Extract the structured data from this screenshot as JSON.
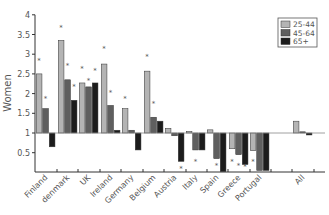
{
  "chart_data": {
    "type": "bar",
    "title": "",
    "xlabel": "",
    "ylabel": "Women",
    "ylim": [
      0.2,
      4
    ],
    "baseline": 1,
    "yticks": [
      0.5,
      1,
      1.5,
      2,
      2.5,
      3,
      3.5,
      4
    ],
    "ytick_labels": [
      "0.5",
      "1",
      "1.5",
      "2",
      "2.5",
      "3",
      "3.5",
      "4"
    ],
    "grid": false,
    "legend_position": "top-right",
    "categories": [
      "Finland",
      "denmark",
      "UK",
      "Ireland",
      "Germany",
      "Belgium",
      "Austria",
      "Italy",
      "Spain",
      "Greece",
      "Portugal",
      "All"
    ],
    "series": [
      {
        "name": "25-44",
        "color": "#b4b4b4",
        "values": [
          2.5,
          3.35,
          2.27,
          2.75,
          1.62,
          2.57,
          1.12,
          1.04,
          1.08,
          0.6,
          0.55,
          1.3
        ]
      },
      {
        "name": "45-64",
        "color": "#5f5f5f",
        "values": [
          1.62,
          2.35,
          2.17,
          1.7,
          1.07,
          1.4,
          0.93,
          0.57,
          0.35,
          0.45,
          0.05,
          1.03
        ]
      },
      {
        "name": "65+",
        "color": "#1c1c1c",
        "values": [
          0.65,
          1.83,
          2.27,
          1.07,
          0.57,
          1.3,
          0.28,
          0.57,
          0.02,
          0.2,
          0.05,
          0.95
        ]
      }
    ],
    "significance_markers": "asterisks shown above/below many bars",
    "markers": [
      {
        "category": "Finland",
        "series": "25-44",
        "y": 2.85
      },
      {
        "category": "Finland",
        "series": "45-64",
        "y": 1.9
      },
      {
        "category": "denmark",
        "series": "25-44",
        "y": 3.7
      },
      {
        "category": "denmark",
        "series": "45-64",
        "y": 2.72
      },
      {
        "category": "denmark",
        "series": "65+",
        "y": 2.2
      },
      {
        "category": "UK",
        "series": "25-44",
        "y": 2.65
      },
      {
        "category": "UK",
        "series": "45-64",
        "y": 2.35
      },
      {
        "category": "UK",
        "series": "65+",
        "y": 2.6
      },
      {
        "category": "Ireland",
        "series": "25-44",
        "y": 3.15
      },
      {
        "category": "Ireland",
        "series": "45-64",
        "y": 2.05
      },
      {
        "category": "Germany",
        "series": "25-44",
        "y": 1.9
      },
      {
        "category": "Belgium",
        "series": "25-44",
        "y": 2.95
      },
      {
        "category": "Belgium",
        "series": "45-64",
        "y": 1.75
      },
      {
        "category": "Austria",
        "series": "65+",
        "y": 0.1
      },
      {
        "category": "Italy",
        "series": "45-64",
        "y": 0.3
      },
      {
        "category": "Spain",
        "series": "45-64",
        "y": 0.2
      },
      {
        "category": "Greece",
        "series": "25-44",
        "y": 0.3
      },
      {
        "category": "Greece",
        "series": "45-64",
        "y": 0.2
      },
      {
        "category": "Greece",
        "series": "65+",
        "y": 0.15
      },
      {
        "category": "Portugal",
        "series": "25-44",
        "y": 0.3
      }
    ]
  }
}
